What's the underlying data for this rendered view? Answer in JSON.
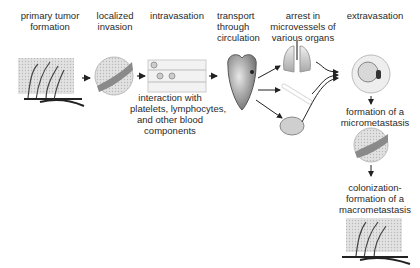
{
  "stages": [
    {
      "id": "primary",
      "label_lines": [
        "primary tumor",
        "formation"
      ]
    },
    {
      "id": "localized",
      "label_lines": [
        "localized",
        "invasion"
      ]
    },
    {
      "id": "intravasation",
      "label_lines": [
        "intravasation"
      ]
    },
    {
      "id": "transport",
      "label_lines": [
        "transport",
        "through",
        "circulation"
      ]
    },
    {
      "id": "arrest",
      "label_lines": [
        "arrest in",
        "microvessels of",
        "various organs"
      ]
    },
    {
      "id": "extravasation",
      "label_lines": [
        "extravasation"
      ]
    }
  ],
  "annotations": {
    "intravasation_note": [
      "interaction with",
      "platelets, lymphocytes,",
      "and other blood",
      "components"
    ],
    "micrometastasis": [
      "formation of a",
      "micrometastasis"
    ],
    "macrometastasis": [
      "colonization-",
      "formation of a",
      "macrometastasis"
    ]
  },
  "organs": [
    "lungs",
    "bone",
    "brain"
  ],
  "colors": {
    "text": "#2a2a2a",
    "arrow": "#222222",
    "tissue": "#c8c8c8",
    "vessel_red": "#b04040"
  }
}
